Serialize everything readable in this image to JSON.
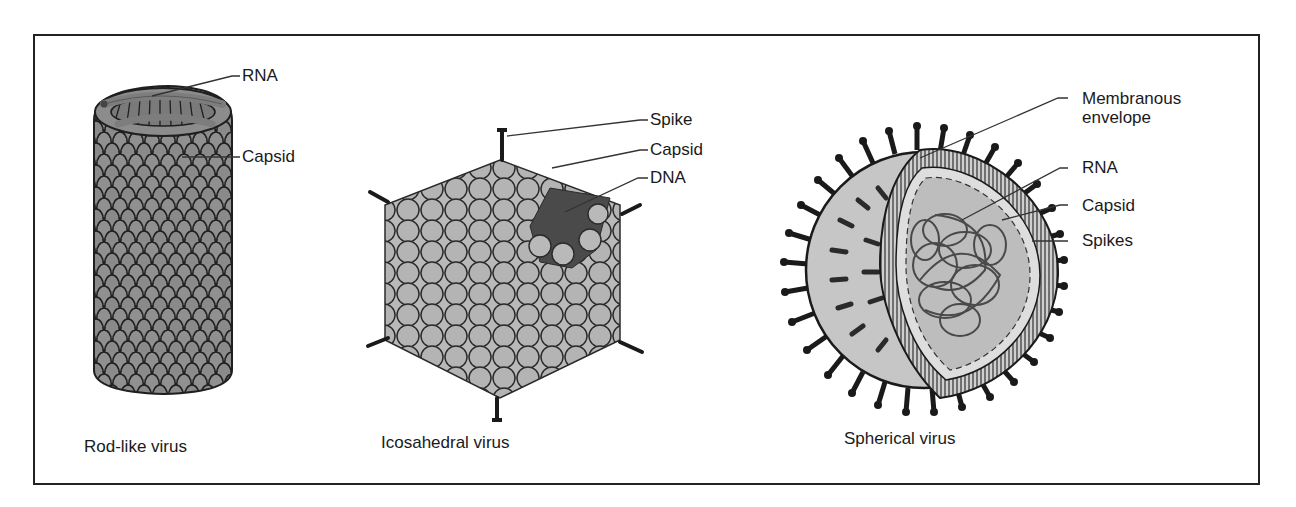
{
  "figure": {
    "panels": [
      {
        "id": "rod",
        "caption": "Rod-like virus",
        "labels": [
          "RNA",
          "Capsid"
        ]
      },
      {
        "id": "icosahedral",
        "caption": "Icosahedral virus",
        "labels": [
          "Spike",
          "Capsid",
          "DNA"
        ]
      },
      {
        "id": "spherical",
        "caption": "Spherical virus",
        "labels": [
          "Membranous",
          "envelope",
          "RNA",
          "Capsid",
          "Spikes"
        ]
      }
    ],
    "colors": {
      "frame": "#222222",
      "capsid_gray": "#8c8c8c",
      "capsid_light": "#b9b9b9",
      "dna_dark": "#4a4a4a",
      "outline": "#1f1f1f"
    }
  }
}
